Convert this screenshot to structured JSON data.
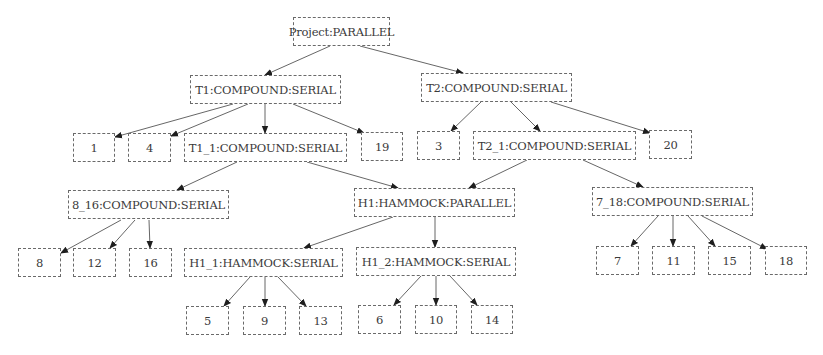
{
  "diagram": {
    "type": "tree",
    "nodes": [
      {
        "id": "project",
        "label": "Project:PARALLEL",
        "box": [
          293,
          17,
          97,
          29
        ]
      },
      {
        "id": "t1",
        "label": "T1:COMPOUND:SERIAL",
        "box": [
          190,
          75,
          151,
          29
        ]
      },
      {
        "id": "t2",
        "label": "T2:COMPOUND:SERIAL",
        "box": [
          421,
          73,
          151,
          29
        ]
      },
      {
        "id": "n1",
        "label": "1",
        "box": [
          73,
          133,
          42,
          29
        ]
      },
      {
        "id": "n4",
        "label": "4",
        "box": [
          128,
          133,
          43,
          29
        ]
      },
      {
        "id": "t1_1",
        "label": "T1_1:COMPOUND:SERIAL",
        "box": [
          184,
          133,
          163,
          29
        ]
      },
      {
        "id": "n19",
        "label": "19",
        "box": [
          361,
          132,
          42,
          29
        ]
      },
      {
        "id": "n3",
        "label": "3",
        "box": [
          417,
          131,
          43,
          29
        ]
      },
      {
        "id": "t2_1",
        "label": "T2_1:COMPOUND:SERIAL",
        "box": [
          473,
          131,
          163,
          29
        ]
      },
      {
        "id": "n20",
        "label": "20",
        "box": [
          649,
          130,
          43,
          29
        ]
      },
      {
        "id": "c8_16",
        "label": "8_16:COMPOUND:SERIAL",
        "box": [
          68,
          190,
          161,
          29
        ]
      },
      {
        "id": "h1",
        "label": "H1:HAMMOCK:PARALLEL",
        "box": [
          354,
          188,
          161,
          29
        ]
      },
      {
        "id": "c7_18",
        "label": "7_18:COMPOUND:SERIAL",
        "box": [
          592,
          187,
          161,
          29
        ]
      },
      {
        "id": "n8",
        "label": "8",
        "box": [
          18,
          248,
          43,
          29
        ]
      },
      {
        "id": "n12",
        "label": "12",
        "box": [
          73,
          248,
          43,
          29
        ]
      },
      {
        "id": "n16",
        "label": "16",
        "box": [
          129,
          248,
          43,
          29
        ]
      },
      {
        "id": "h1_1",
        "label": "H1_1:HAMMOCK:SERIAL",
        "box": [
          184,
          248,
          159,
          29
        ]
      },
      {
        "id": "h1_2",
        "label": "H1_2:HAMMOCK:SERIAL",
        "box": [
          356,
          247,
          160,
          29
        ]
      },
      {
        "id": "n7",
        "label": "7",
        "box": [
          596,
          246,
          43,
          29
        ]
      },
      {
        "id": "n11",
        "label": "11",
        "box": [
          652,
          246,
          43,
          29
        ]
      },
      {
        "id": "n15",
        "label": "15",
        "box": [
          708,
          246,
          43,
          29
        ]
      },
      {
        "id": "n18",
        "label": "18",
        "box": [
          765,
          246,
          42,
          29
        ]
      },
      {
        "id": "n5",
        "label": "5",
        "box": [
          186,
          306,
          43,
          29
        ]
      },
      {
        "id": "n9",
        "label": "9",
        "box": [
          243,
          306,
          43,
          29
        ]
      },
      {
        "id": "n13",
        "label": "13",
        "box": [
          299,
          306,
          43,
          29
        ]
      },
      {
        "id": "n6",
        "label": "6",
        "box": [
          358,
          305,
          43,
          29
        ]
      },
      {
        "id": "n10",
        "label": "10",
        "box": [
          415,
          305,
          42,
          29
        ]
      },
      {
        "id": "n14",
        "label": "14",
        "box": [
          471,
          305,
          42,
          29
        ]
      }
    ],
    "edges": [
      {
        "from": "project",
        "to": "t1",
        "path": [
          330,
          46,
          265,
          75
        ]
      },
      {
        "from": "project",
        "to": "t2",
        "path": [
          360,
          46,
          463,
          73
        ]
      },
      {
        "from": "t1",
        "to": "n1",
        "path": [
          233,
          104,
          115,
          137
        ]
      },
      {
        "from": "t1",
        "to": "n4",
        "path": [
          248,
          104,
          171,
          136
        ]
      },
      {
        "from": "t1",
        "to": "t1_1",
        "path": [
          265,
          104,
          265,
          133
        ]
      },
      {
        "from": "t1",
        "to": "n19",
        "path": [
          293,
          104,
          364,
          133
        ]
      },
      {
        "from": "t2",
        "to": "n3",
        "path": [
          481,
          102,
          451,
          131
        ]
      },
      {
        "from": "t2",
        "to": "t2_1",
        "path": [
          511,
          102,
          540,
          131
        ]
      },
      {
        "from": "t2",
        "to": "n20",
        "path": [
          551,
          102,
          650,
          133
        ]
      },
      {
        "from": "t1_1",
        "to": "c8_16",
        "path": [
          237,
          162,
          177,
          190
        ]
      },
      {
        "from": "t1_1",
        "to": "h1",
        "path": [
          307,
          162,
          398,
          188
        ]
      },
      {
        "from": "t2_1",
        "to": "h1",
        "path": [
          527,
          160,
          469,
          188
        ]
      },
      {
        "from": "t2_1",
        "to": "c7_18",
        "path": [
          583,
          160,
          643,
          187
        ]
      },
      {
        "from": "c8_16",
        "to": "n8",
        "path": [
          121,
          220,
          61,
          253
        ]
      },
      {
        "from": "c8_16",
        "to": "n12",
        "path": [
          135,
          220,
          110,
          248
        ]
      },
      {
        "from": "c8_16",
        "to": "n16",
        "path": [
          149,
          220,
          150,
          248
        ]
      },
      {
        "from": "h1",
        "to": "h1_1",
        "path": [
          393,
          217,
          304,
          248
        ]
      },
      {
        "from": "h1",
        "to": "h1_2",
        "path": [
          435,
          217,
          435,
          247
        ]
      },
      {
        "from": "c7_18",
        "to": "n7",
        "path": [
          658,
          216,
          631,
          246
        ]
      },
      {
        "from": "c7_18",
        "to": "n11",
        "path": [
          673,
          216,
          673,
          246
        ]
      },
      {
        "from": "c7_18",
        "to": "n15",
        "path": [
          688,
          216,
          715,
          246
        ]
      },
      {
        "from": "c7_18",
        "to": "n18",
        "path": [
          702,
          216,
          767,
          249
        ]
      },
      {
        "from": "h1_1",
        "to": "n5",
        "path": [
          250,
          277,
          224,
          306
        ]
      },
      {
        "from": "h1_1",
        "to": "n9",
        "path": [
          265,
          277,
          265,
          306
        ]
      },
      {
        "from": "h1_1",
        "to": "n13",
        "path": [
          278,
          277,
          306,
          306
        ]
      },
      {
        "from": "h1_2",
        "to": "n6",
        "path": [
          421,
          276,
          394,
          305
        ]
      },
      {
        "from": "h1_2",
        "to": "n10",
        "path": [
          436,
          276,
          436,
          305
        ]
      },
      {
        "from": "h1_2",
        "to": "n14",
        "path": [
          450,
          276,
          477,
          305
        ]
      }
    ]
  }
}
